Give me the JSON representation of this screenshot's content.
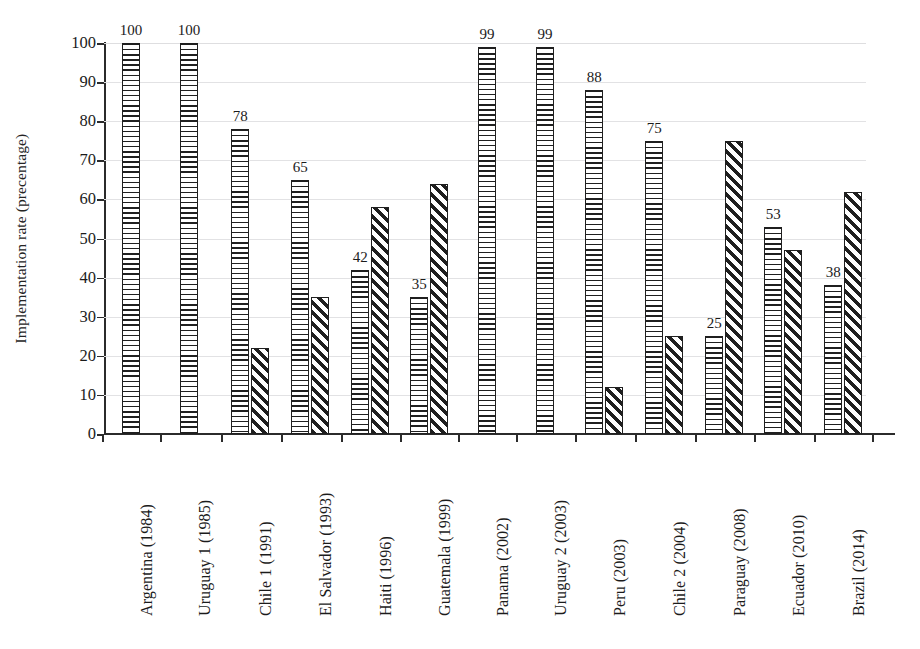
{
  "chart_data": {
    "type": "bar",
    "title": "",
    "xlabel": "",
    "ylabel": "Implementation rate (precentage)",
    "ylim": [
      0,
      100
    ],
    "yticks": [
      0,
      10,
      20,
      30,
      40,
      50,
      60,
      70,
      80,
      90,
      100
    ],
    "grid": true,
    "legend_position": "none",
    "categories": [
      "Argentina (1984)",
      "Uruguay 1 (1985)",
      "Chile 1 (1991)",
      "El Salvador (1993)",
      "Haiti (1996)",
      "Guatemala (1999)",
      "Panama (2002)",
      "Uruguay 2 (2003)",
      "Peru (2003)",
      "Chile 2 (2004)",
      "Paraguay (2008)",
      "Ecuador (2010)",
      "Brazil (2014)"
    ],
    "series": [
      {
        "name": "series-1",
        "pattern": "horizontal-hatch",
        "labeled": true,
        "values": [
          100,
          100,
          78,
          65,
          42,
          35,
          99,
          99,
          88,
          75,
          25,
          53,
          38
        ],
        "data_labels": [
          "100",
          "100",
          "78",
          "65",
          "42",
          "35",
          "99",
          "99",
          "88",
          "75",
          "25",
          "53",
          "38"
        ]
      },
      {
        "name": "series-2",
        "pattern": "diagonal-hatch",
        "labeled": false,
        "values": [
          null,
          null,
          22,
          35,
          58,
          64,
          null,
          null,
          12,
          25,
          75,
          47,
          62
        ],
        "data_labels": [
          "",
          "",
          "",
          "",
          "",
          "",
          "",
          "",
          "",
          "",
          "",
          "",
          ""
        ]
      }
    ],
    "colors": {
      "bar_outline": "#1f1f1f",
      "bar_fill": "#ffffff",
      "hatch": "#1f1f1f",
      "axis": "#2b2b2b",
      "grid": "#e2e2e4",
      "text": "#1b1b1b"
    }
  }
}
